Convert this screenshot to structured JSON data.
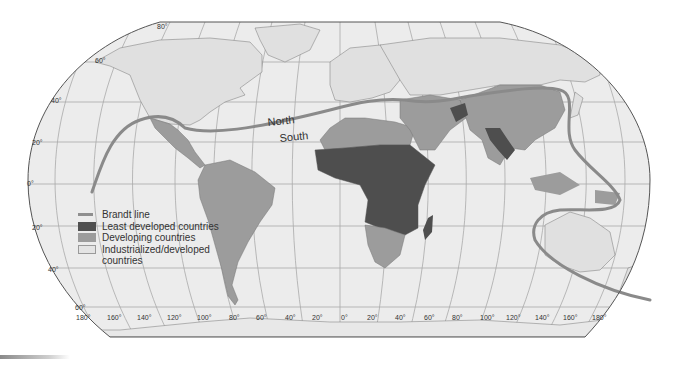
{
  "map": {
    "title": "North–South divide (Brandt line) world map",
    "projection": "Robinson-style world map",
    "labels": {
      "north": "North",
      "south": "South"
    },
    "latitude_labels_left": [
      "80°",
      "60°",
      "40°",
      "20°",
      "0°",
      "20°",
      "40°",
      "60°"
    ],
    "longitude_labels_bottom": [
      "180°",
      "160°",
      "140°",
      "120°",
      "100°",
      "80°",
      "60°",
      "40°",
      "20°",
      "0°",
      "20°",
      "40°",
      "60°",
      "80°",
      "100°",
      "120°",
      "140°",
      "160°",
      "180°"
    ],
    "colors": {
      "ocean": "#ededed",
      "industrialized": "#e2e2e2",
      "developing": "#9c9c9c",
      "least_developed": "#4e4e4e",
      "brandt_line": "#8a8a8a",
      "grid": "#a8a8a8",
      "border": "#555555"
    }
  },
  "legend": {
    "items": [
      {
        "label": "Brandt line",
        "type": "line"
      },
      {
        "label": "Least developed countries",
        "type": "least_developed"
      },
      {
        "label": "Developing countries",
        "type": "developing"
      },
      {
        "label": "Industrialized/developed",
        "type": "industrialized"
      }
    ],
    "continuation": "countries"
  }
}
